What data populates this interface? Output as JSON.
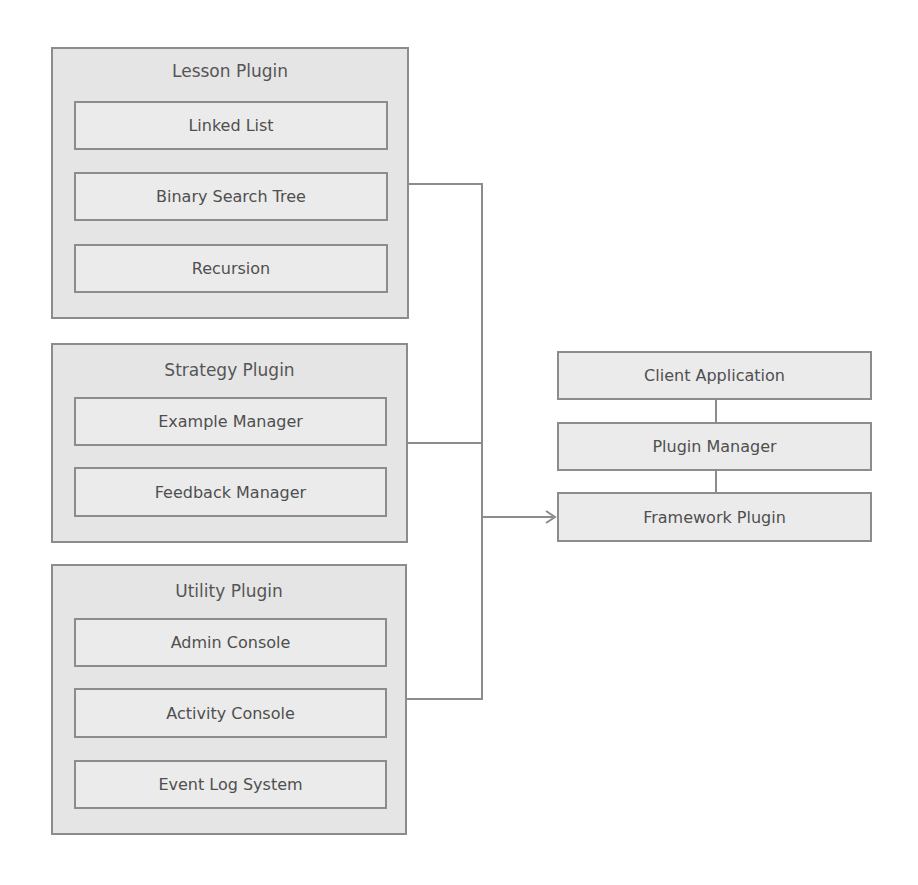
{
  "diagram": {
    "groups": [
      {
        "title": "Lesson Plugin",
        "items": [
          "Linked List",
          "Binary Search Tree",
          "Recursion"
        ]
      },
      {
        "title": "Strategy Plugin",
        "items": [
          "Example Manager",
          "Feedback Manager"
        ]
      },
      {
        "title": "Utility Plugin",
        "items": [
          "Admin Console",
          "Activity Console",
          "Event Log System"
        ]
      }
    ],
    "stack": [
      "Client Application",
      "Plugin Manager",
      "Framework Plugin"
    ],
    "colors": {
      "border": "#8c8c8c",
      "group_fill": "#e5e5e5",
      "node_fill": "#ebebeb",
      "text": "#555555"
    }
  }
}
